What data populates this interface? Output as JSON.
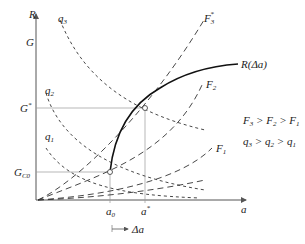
{
  "diagram": {
    "axes": {
      "y_label": "R",
      "y_label_2": "G",
      "x_label": "a"
    },
    "y_ticks": [
      {
        "main": "G",
        "sup": "*",
        "sub": ""
      },
      {
        "main": "G",
        "sup": "",
        "sub": "C0"
      }
    ],
    "x_ticks": [
      {
        "main": "a",
        "sub": "0",
        "sup": ""
      },
      {
        "main": "a",
        "sub": "",
        "sup": "*"
      }
    ],
    "delta_arrow_label": "Δa",
    "curves": {
      "F3": {
        "main": "F",
        "sub": "3",
        "sup": "*"
      },
      "F2": {
        "main": "F",
        "sub": "2"
      },
      "F1": {
        "main": "F",
        "sub": "1"
      },
      "q3": {
        "main": "q",
        "sub": "3"
      },
      "q2": {
        "main": "q",
        "sub": "2"
      },
      "q1": {
        "main": "q",
        "sub": "1"
      },
      "R": {
        "label": "R(Δa)"
      }
    },
    "legend": {
      "line1": [
        "F",
        "3",
        " > ",
        "F",
        "2",
        " > ",
        "F",
        "1"
      ],
      "line2": [
        "q",
        "3",
        " > ",
        "q",
        "2",
        " > ",
        "q",
        "1"
      ]
    }
  }
}
